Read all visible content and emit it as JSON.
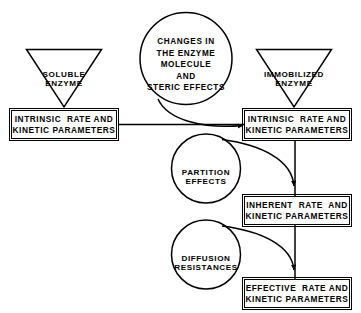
{
  "diagram": {
    "colors": {
      "stroke": "#000000",
      "background": "#ffffff"
    },
    "nodes": {
      "soluble_enzyme": {
        "shape": "triangle-down",
        "line1": "SOLUBLE",
        "line2": "ENZYME"
      },
      "changes_circle": {
        "shape": "circle",
        "line1": "CHANGES  IN",
        "line2": "THE ENZYME",
        "line3": "MOLECULE",
        "line4": "AND",
        "line5": "STERIC EFFECTS"
      },
      "immobilized_enzyme": {
        "shape": "triangle-down",
        "line1": "IMMOBILIZED",
        "line2": "ENZYME"
      },
      "intrinsic_left": {
        "shape": "box",
        "line1": "INTRINSIC  RATE AND",
        "line2": "KINETIC PARAMETERS"
      },
      "intrinsic_right": {
        "shape": "box",
        "line1": "INTRINSIC  RATE AND",
        "line2": "KINETIC PARAMETERS"
      },
      "partition_effects": {
        "shape": "circle",
        "line1": "PARTITION",
        "line2": "EFFECTS"
      },
      "inherent": {
        "shape": "box",
        "line1": "INHERENT  RATE  AND",
        "line2": "KINETIC PARAMETERS"
      },
      "diffusion_resistances": {
        "shape": "circle",
        "line1": "DIFFUSION",
        "line2": "RESISTANCES"
      },
      "effective": {
        "shape": "box",
        "line1": "EFFECTIVE  RATE AND",
        "line2": "KINETIC PARAMETERS"
      }
    },
    "connectors": [
      {
        "name": "soluble-to-intrinsic-left",
        "type": "implicit-apex"
      },
      {
        "name": "immobilized-to-intrinsic-right",
        "type": "implicit-apex"
      },
      {
        "name": "intrinsic-left-to-intrinsic-right",
        "type": "straight"
      },
      {
        "name": "changes-circle-to-intrinsic-right",
        "type": "curve-arrow"
      },
      {
        "name": "intrinsic-right-to-inherent",
        "type": "straight-vertical"
      },
      {
        "name": "partition-to-inherent",
        "type": "curve-arrow"
      },
      {
        "name": "inherent-to-effective",
        "type": "straight-vertical"
      },
      {
        "name": "diffusion-to-effective",
        "type": "curve-arrow"
      }
    ]
  }
}
